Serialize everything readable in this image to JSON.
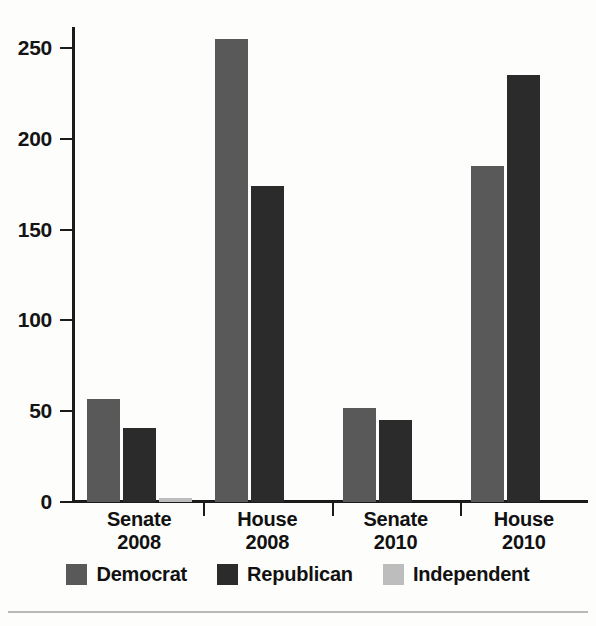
{
  "chart_data": {
    "type": "bar",
    "title": "",
    "subtitle": "",
    "xlabel": "",
    "ylabel": "",
    "grid": false,
    "legend_position": "bottom",
    "ylim": [
      0,
      265
    ],
    "yticks": [
      0,
      50,
      100,
      150,
      200,
      250
    ],
    "ytick_labels": [
      "0",
      "50",
      "100",
      "150",
      "200",
      "250"
    ],
    "categories": [
      "Senate\n2008",
      "House\n2008",
      "Senate\n2010",
      "House\n2010"
    ],
    "category_lines": [
      [
        "Senate",
        "2008"
      ],
      [
        "House",
        "2008"
      ],
      [
        "Senate",
        "2010"
      ],
      [
        "House",
        "2010"
      ]
    ],
    "series": [
      {
        "name": "Democrat",
        "color": "#595959",
        "values": [
          57,
          255,
          52,
          185
        ]
      },
      {
        "name": "Republican",
        "color": "#2b2b2b",
        "values": [
          41,
          174,
          45,
          235
        ]
      },
      {
        "name": "Independent",
        "color": "#bdbdbd",
        "values": [
          2,
          0,
          0,
          0
        ]
      }
    ]
  },
  "axis": {
    "ticks": [
      {
        "label": "250",
        "value": 250
      },
      {
        "label": "200",
        "value": 200
      },
      {
        "label": "150",
        "value": 150
      },
      {
        "label": "100",
        "value": 100
      },
      {
        "label": "50",
        "value": 50
      },
      {
        "label": "0",
        "value": 0
      }
    ]
  },
  "groups": [
    {
      "line1": "Senate",
      "line2": "2008"
    },
    {
      "line1": "House",
      "line2": "2008"
    },
    {
      "line1": "Senate",
      "line2": "2010"
    },
    {
      "line1": "House",
      "line2": "2010"
    }
  ],
  "legend": {
    "items": [
      {
        "label": "Democrat",
        "color": "#595959"
      },
      {
        "label": "Republican",
        "color": "#2b2b2b"
      },
      {
        "label": "Independent",
        "color": "#bdbdbd"
      }
    ]
  },
  "colors": {
    "democrat": "#595959",
    "republican": "#2b2b2b",
    "independent": "#bdbdbd",
    "axis": "#1b1b1b",
    "background": "#fdfdfc",
    "rule": "#b9b9b9"
  }
}
